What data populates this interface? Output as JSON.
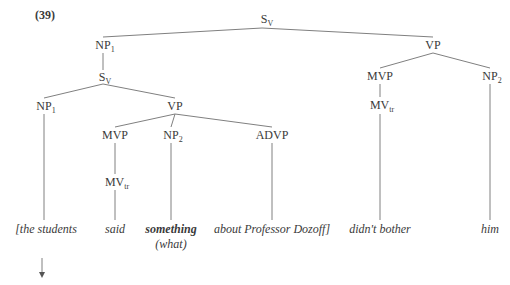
{
  "example_number": "(39)",
  "nodes": {
    "root": {
      "cat": "S",
      "sub": "V"
    },
    "np1_top": {
      "cat": "NP",
      "sub": "1"
    },
    "vp_top": {
      "cat": "VP",
      "sub": ""
    },
    "s_inner": {
      "cat": "S",
      "sub": "V"
    },
    "np1_inner": {
      "cat": "NP",
      "sub": "1"
    },
    "vp_inner": {
      "cat": "VP",
      "sub": ""
    },
    "mvp_left": {
      "cat": "MVP",
      "sub": ""
    },
    "np2_left": {
      "cat": "NP",
      "sub": "2"
    },
    "advp": {
      "cat": "ADVP",
      "sub": ""
    },
    "mvtr_left": {
      "cat": "MV",
      "sub": "tr"
    },
    "mvp_right": {
      "cat": "MVP",
      "sub": ""
    },
    "np2_right": {
      "cat": "NP",
      "sub": "2"
    },
    "mvtr_right": {
      "cat": "MV",
      "sub": "tr"
    }
  },
  "leaves": {
    "the_students": "[the students",
    "said": "said",
    "something": "something",
    "what": "(what)",
    "about": "about Professor Dozoff]",
    "didnt_bother": "didn't bother",
    "him": "him"
  },
  "colors": {
    "line": "#808080",
    "text": "#3a3a3a"
  }
}
